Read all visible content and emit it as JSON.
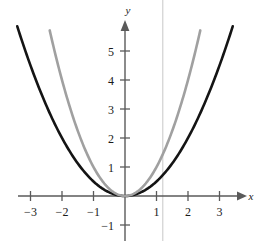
{
  "figure": {
    "background_color": "#ffffff",
    "axis_color": "#5a5a5a",
    "tick_text_color": "#1a1a1a",
    "guide_line_color": "#b9b9b9"
  },
  "axes": {
    "x_axis_label": "x",
    "y_axis_label": "y",
    "x_tick_labels": [
      "−3",
      "−2",
      "−1",
      "1",
      "2",
      "3"
    ],
    "x_tick_values": [
      -3,
      -2,
      -1,
      1,
      2,
      3
    ],
    "y_tick_labels": [
      "−1",
      "1",
      "2",
      "3",
      "4",
      "5"
    ],
    "y_tick_values": [
      -1,
      1,
      2,
      3,
      4,
      5
    ],
    "origin_px": {
      "x": 125,
      "y": 196
    },
    "px_per_unit_x": 31.5,
    "px_per_unit_y": 29,
    "x_arrow_tip_px": 246,
    "y_arrow_tip_px": 21
  },
  "chart_data": {
    "type": "line",
    "title": "",
    "subtitle": "",
    "xlabel": "x",
    "ylabel": "y",
    "xlim": [
      -3.6,
      3.7
    ],
    "ylim": [
      -1.6,
      6.0
    ],
    "grid": false,
    "legend": "none",
    "x_ticks": [
      -3,
      -2,
      -1,
      1,
      2,
      3
    ],
    "y_ticks": [
      -1,
      1,
      2,
      3,
      4,
      5
    ],
    "series": [
      {
        "name": "wide parabola",
        "equation": "y = 0.5 x^2",
        "color": "#141414",
        "line_width": 2.6,
        "x_domain": [
          -3.42,
          3.42
        ],
        "x": [
          -3.42,
          -3.0,
          -2.5,
          -2.0,
          -1.5,
          -1.0,
          -0.5,
          0.0,
          0.5,
          1.0,
          1.5,
          2.0,
          2.5,
          3.0,
          3.42
        ],
        "values": [
          5.85,
          4.5,
          3.13,
          2.0,
          1.13,
          0.5,
          0.13,
          0.0,
          0.13,
          0.5,
          1.13,
          2.0,
          3.13,
          4.5,
          5.85
        ]
      },
      {
        "name": "narrow parabola",
        "equation": "y = x^2",
        "color": "#a0a0a0",
        "line_width": 2.6,
        "x_domain": [
          -2.39,
          2.39
        ],
        "x": [
          -2.39,
          -2.0,
          -1.75,
          -1.5,
          -1.25,
          -1.0,
          -0.75,
          -0.5,
          -0.25,
          0.0,
          0.25,
          0.5,
          0.75,
          1.0,
          1.25,
          1.5,
          1.75,
          2.0,
          2.39
        ],
        "values": [
          5.71,
          4.0,
          3.06,
          2.25,
          1.56,
          1.0,
          0.56,
          0.25,
          0.06,
          0.0,
          0.06,
          0.25,
          0.56,
          1.0,
          1.56,
          2.25,
          3.06,
          4.0,
          5.71
        ]
      }
    ],
    "annotations": [
      {
        "name": "vertical guide line",
        "type": "vline",
        "x": 1.2,
        "color": "#b9b9b9",
        "line_width": 0.8
      }
    ]
  }
}
